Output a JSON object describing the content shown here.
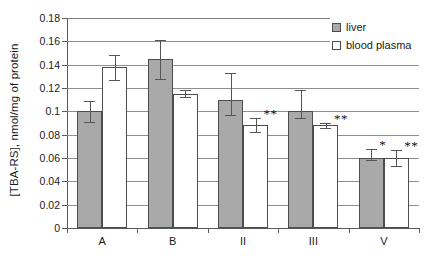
{
  "chart_data": {
    "type": "bar",
    "title": "",
    "xlabel": "",
    "ylabel": "[TBA-RS], nmol/mg of protein",
    "ylim": [
      0,
      0.18
    ],
    "ytick_labels": [
      "0.18",
      "0.16",
      "0.14",
      "0.12",
      "0.1",
      "0.08",
      "0.06",
      "0.04",
      "0.02",
      "0"
    ],
    "ytick_values": [
      0.18,
      0.16,
      0.14,
      0.12,
      0.1,
      0.08,
      0.06,
      0.04,
      0.02,
      0
    ],
    "grid": "horizontal",
    "legend_position": "top-right-inside",
    "categories": [
      "A",
      "B",
      "II",
      "III",
      "V"
    ],
    "series": [
      {
        "name": "liver",
        "color": "#a9a9a9",
        "values": [
          0.1,
          0.145,
          0.11,
          0.1,
          0.06
        ],
        "error_low": [
          0.091,
          0.128,
          0.097,
          0.094,
          0.058
        ],
        "error_high": [
          0.109,
          0.161,
          0.133,
          0.118,
          0.068
        ],
        "significance": [
          "",
          "",
          "",
          "",
          "*"
        ]
      },
      {
        "name": "blood plasma",
        "color": "#ffffff",
        "values": [
          0.138,
          0.115,
          0.088,
          0.088,
          0.06
        ],
        "error_low": [
          0.127,
          0.112,
          0.082,
          0.086,
          0.053
        ],
        "error_high": [
          0.148,
          0.118,
          0.094,
          0.09,
          0.067
        ],
        "significance": [
          "",
          "",
          "**",
          "**",
          "**"
        ]
      }
    ]
  },
  "legend": {
    "items": [
      {
        "label": "liver",
        "swatch": "liver"
      },
      {
        "label": "blood plasma",
        "swatch": "plasma"
      }
    ]
  }
}
